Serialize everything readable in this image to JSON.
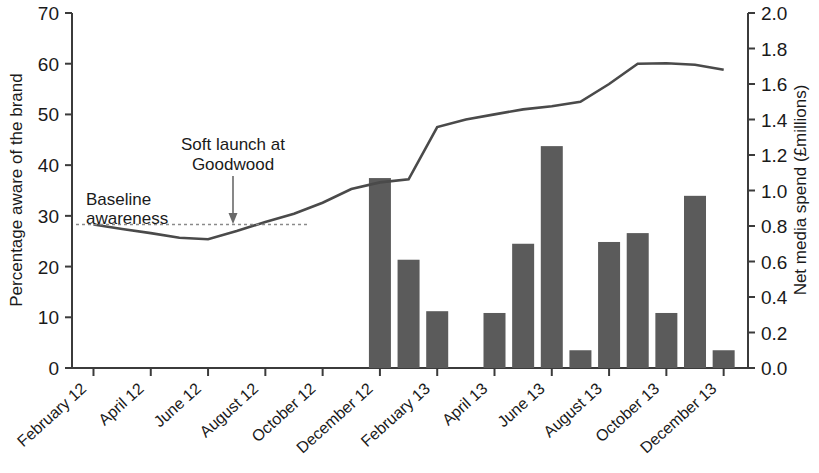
{
  "chart_data": {
    "type": "bar",
    "title": "",
    "subtitle": "",
    "xlabel": "",
    "ylabel": "Percentage aware of the brand",
    "y2label": "Net media spend (£millions)",
    "ylim": [
      0,
      70
    ],
    "y2lim": [
      0.0,
      2.0
    ],
    "grid": false,
    "legend_position": "none",
    "y_ticks": [
      "0",
      "10",
      "20",
      "30",
      "40",
      "50",
      "60",
      "70"
    ],
    "y_tick_values": [
      0,
      10,
      20,
      30,
      40,
      50,
      60,
      70
    ],
    "y2_ticks": [
      "0.0",
      "0.2",
      "0.4",
      "0.6",
      "0.8",
      "1.0",
      "1.2",
      "1.4",
      "1.6",
      "1.8",
      "2.0"
    ],
    "y2_tick_values": [
      0.0,
      0.2,
      0.4,
      0.6,
      0.8,
      1.0,
      1.2,
      1.4,
      1.6,
      1.8,
      2.0
    ],
    "categories": [
      "February 12",
      "March 12",
      "April 12",
      "May 12",
      "June 12",
      "July 12",
      "August 12",
      "September 12",
      "October 12",
      "November 12",
      "December 12",
      "January 13",
      "February 13",
      "March 13",
      "April 13",
      "May 13",
      "June 13",
      "July 13",
      "August 13",
      "September 13",
      "October 13",
      "November 13",
      "December 13"
    ],
    "tick_labels": [
      "February 12",
      "April 12",
      "June 12",
      "August 12",
      "October 12",
      "December 12",
      "February 13",
      "April 13",
      "June 13",
      "August 13",
      "October 13",
      "December 13"
    ],
    "series": [
      {
        "name": "Percentage aware of the brand",
        "type": "line",
        "axis": "left",
        "color": "#4a4a4a",
        "x": [
          "February 12",
          "March 12",
          "April 12",
          "May 12",
          "June 12",
          "July 12",
          "August 12",
          "September 12",
          "October 12",
          "November 12",
          "December 12",
          "January 13",
          "February 13",
          "March 13",
          "April 13",
          "May 13",
          "June 13",
          "July 13",
          "August 13",
          "September 13",
          "October 13",
          "November 13",
          "December 13"
        ],
        "values": [
          28.3,
          27.4,
          26.6,
          25.7,
          25.4,
          27.0,
          28.8,
          30.4,
          32.6,
          35.3,
          36.6,
          37.2,
          47.5,
          49.0,
          50.0,
          51.0,
          51.6,
          52.5,
          56.0,
          60.0,
          60.1,
          59.8,
          58.8
        ]
      },
      {
        "name": "Net media spend (£millions)",
        "type": "bar",
        "axis": "right",
        "color": "#5b5b5b",
        "x": [
          "December 12",
          "January 13",
          "February 13",
          "March 13",
          "April 13",
          "May 13",
          "June 13",
          "July 13",
          "August 13",
          "September 13",
          "October 13",
          "November 13",
          "December 13"
        ],
        "values": [
          1.07,
          0.61,
          0.32,
          0.0,
          0.31,
          0.7,
          1.25,
          0.1,
          0.71,
          0.76,
          0.31,
          0.97,
          0.1
        ]
      }
    ],
    "annotations": [
      {
        "id": "baseline-awareness",
        "text_line1": "Baseline",
        "text_line2": "awareness",
        "value": 28.3,
        "note": "dashed horizontal reference line at baseline awareness level"
      },
      {
        "id": "soft-launch",
        "text_line1": "Soft launch at",
        "text_line2": "Goodwood",
        "at_category": "June 12",
        "note": "downward arrow pointing at the awareness line"
      }
    ]
  },
  "axes": {
    "left_title": "Percentage aware of the brand",
    "right_title": "Net media spend (£millions)"
  },
  "annotations": {
    "baseline_line1": "Baseline",
    "baseline_line2": "awareness",
    "softlaunch_line1": "Soft launch at",
    "softlaunch_line2": "Goodwood"
  },
  "colors": {
    "bar": "#5b5b5b",
    "line": "#4a4a4a",
    "axis": "#3b3b3b",
    "dash": "#8a8a8a",
    "background": "#ffffff"
  }
}
